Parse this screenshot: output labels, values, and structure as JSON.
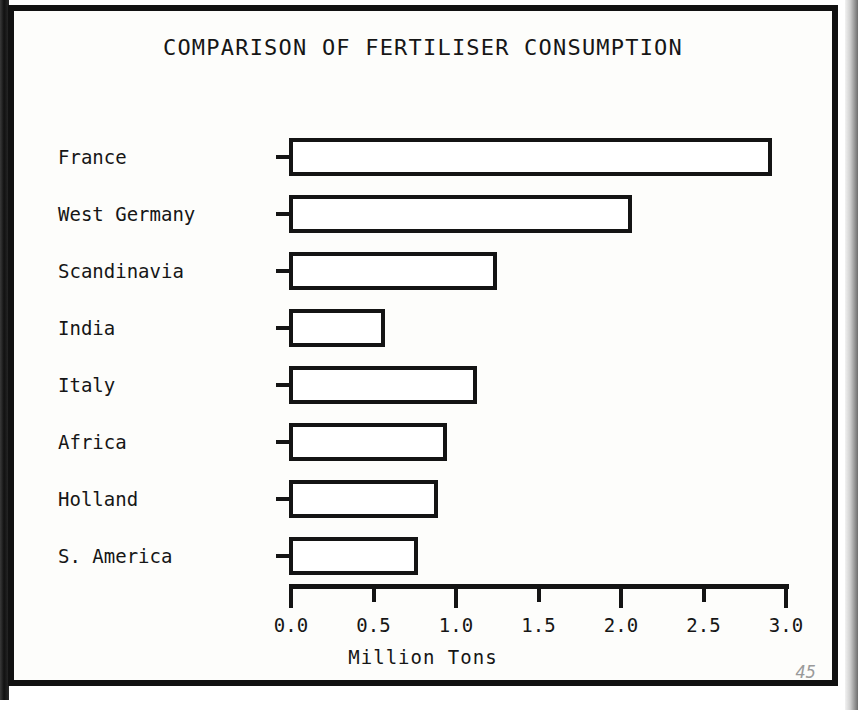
{
  "figure": {
    "title": "COMPARISON OF FERTILISER CONSUMPTION",
    "page_number": "45",
    "ink_color": "#141414",
    "paper_color": "#fdfdfb"
  },
  "chart_data": {
    "type": "bar",
    "orientation": "horizontal",
    "title": "COMPARISON OF FERTILISER CONSUMPTION",
    "xlabel": "Million Tons",
    "ylabel": "",
    "categories": [
      "France",
      "West Germany",
      "Scandinavia",
      "India",
      "Italy",
      "Africa",
      "Holland",
      "S. America"
    ],
    "values": [
      2.93,
      2.08,
      1.26,
      0.58,
      1.14,
      0.96,
      0.9,
      0.78
    ],
    "xlim": [
      0.0,
      3.0
    ],
    "xticks": [
      0.0,
      0.5,
      1.0,
      1.5,
      2.0,
      2.5,
      3.0
    ],
    "xtick_labels": [
      "0.0",
      "0.5",
      "1.0",
      "1.5",
      "2.0",
      "2.5",
      "3.0"
    ],
    "major_ticks": [
      0.0,
      1.0,
      2.0,
      3.0
    ],
    "minor_ticks": [
      0.5,
      1.5,
      2.5
    ],
    "grid": false,
    "legend": false,
    "bar_fill": "#ffffff",
    "bar_edge": "#141414"
  }
}
